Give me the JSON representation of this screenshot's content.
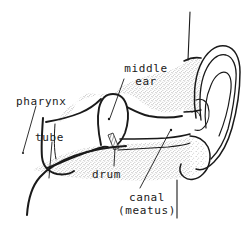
{
  "figure": {
    "background_color": "#ffffff",
    "ink_color": "#1a1a1a",
    "stipple_color": "#4a4a4a"
  },
  "labels": {
    "pharynx": "pharynx",
    "tube": "tube",
    "middle_ear_line1": "middle",
    "middle_ear_line2": "ear",
    "drum": "drum",
    "canal_line1": "canal",
    "canal_line2": "(meatus)"
  },
  "parts": [
    {
      "name": "pharynx",
      "label": "pharynx"
    },
    {
      "name": "eustachian-tube",
      "label": "tube"
    },
    {
      "name": "middle-ear",
      "label": "middle ear"
    },
    {
      "name": "eardrum",
      "label": "drum"
    },
    {
      "name": "ear-canal",
      "label": "canal (meatus)"
    },
    {
      "name": "pinna",
      "label": ""
    },
    {
      "name": "earlobe",
      "label": ""
    }
  ]
}
